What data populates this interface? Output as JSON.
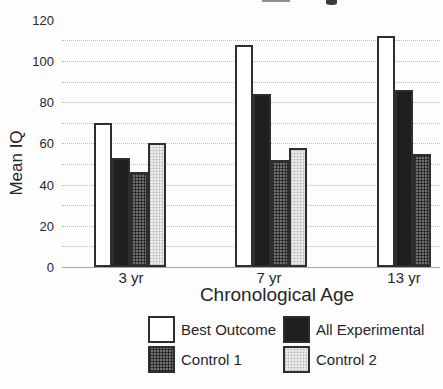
{
  "chart_data": {
    "type": "bar",
    "categories": [
      "3 yr",
      "7 yr",
      "13 yr"
    ],
    "series": [
      {
        "name": "Best Outcome",
        "swatch": "white",
        "fill": "#ffffff",
        "values": [
          70,
          108,
          112
        ]
      },
      {
        "name": "All Experimental",
        "swatch": "black",
        "fill": "#1e1e1e",
        "values": [
          53,
          84,
          86
        ]
      },
      {
        "name": "Control 1",
        "swatch": "crosshatch",
        "fill": "#6f6f6f",
        "values": [
          46,
          52,
          55
        ]
      },
      {
        "name": "Control 2",
        "swatch": "lightdots",
        "fill": "#ebebeb",
        "values": [
          60,
          58,
          null
        ]
      }
    ],
    "xlabel": "Chronological Age",
    "ylabel": "Mean IQ",
    "ylim": [
      0,
      120
    ],
    "yticks": [
      0,
      20,
      40,
      60,
      80,
      100,
      120
    ],
    "gridline_interval": 10,
    "grid": "dotted-horizontal",
    "legend_position": "bottom",
    "legend_columns": 2
  },
  "colors": {
    "bar_outline": "#2e2e2e",
    "all_experimental_fill": "#1e1e1e",
    "control1_fill": "#6f6f6f",
    "control2_fill": "#ebebeb",
    "gridline": "#bdbdbd",
    "axis_baseline": "#a6a6a6",
    "text": "#262626",
    "background": "#fdfdfd"
  }
}
